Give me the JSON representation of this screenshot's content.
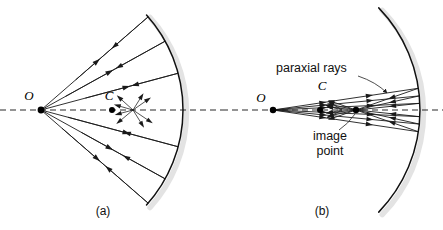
{
  "figure": {
    "background_color": "#ffffff",
    "ink_color": "#1a1a1a",
    "halo_color": "#e3e3e3"
  },
  "panels": [
    {
      "id": "a",
      "caption": "(a)",
      "caption_x": 103,
      "caption_y": 215,
      "description": "Wide-angle rays from a point source O reflect off a concave mirror and do not converge to a single point (spherical aberration).",
      "source_label": "O",
      "source_label_x": 29,
      "source_label_y": 100,
      "source_point": {
        "x": 41,
        "y": 110,
        "r": 3.4
      },
      "center_label": "C",
      "center_label_x": 109,
      "center_label_y": 100,
      "center_point": {
        "x": 112,
        "y": 110,
        "r": 3.0
      },
      "axis": {
        "x1": 0,
        "y1": 110,
        "x2": 222,
        "y2": 110
      },
      "mirror": {
        "center_x": 41,
        "center_y": 110,
        "radius": 142,
        "start_angle_deg": -42,
        "end_angle_deg": 42,
        "vertex_x": 183
      },
      "incident_rays": [
        {
          "angle_deg": -41,
          "arrow_t": 0.52
        },
        {
          "angle_deg": -29,
          "arrow_t": 0.55
        },
        {
          "angle_deg": -15,
          "arrow_t": 0.62
        },
        {
          "angle_deg": 15,
          "arrow_t": 0.62
        },
        {
          "angle_deg": 29,
          "arrow_t": 0.55
        },
        {
          "angle_deg": 41,
          "arrow_t": 0.52
        }
      ],
      "caustic_center": {
        "x": 133,
        "y": 110
      },
      "short_arrows": [
        {
          "angle_deg": 140,
          "len": 18
        },
        {
          "angle_deg": 165,
          "len": 15
        },
        {
          "angle_deg": 196,
          "len": 16
        },
        {
          "angle_deg": 222,
          "len": 18
        },
        {
          "angle_deg": 58,
          "len": 17
        },
        {
          "angle_deg": 34,
          "len": 20
        },
        {
          "angle_deg": 325,
          "len": 18
        },
        {
          "angle_deg": 302,
          "len": 16
        }
      ]
    },
    {
      "id": "b",
      "caption": "(b)",
      "caption_x": 322,
      "caption_y": 215,
      "description": "Paraxial rays making small angles with the axis converge to a sharp image point.",
      "source_label": "O",
      "source_label_x": 261,
      "source_label_y": 102,
      "source_point": {
        "x": 273,
        "y": 110,
        "r": 3.2
      },
      "center_label": "C",
      "center_label_x": 322,
      "center_label_y": 90,
      "center_point": {
        "x": 320,
        "y": 110,
        "r": 3.0
      },
      "image_point": {
        "x": 356,
        "y": 110,
        "r": 3.2
      },
      "axis": {
        "x1": 222,
        "y1": 110,
        "x2": 443,
        "y2": 110
      },
      "mirror": {
        "center_x": 273,
        "center_y": 110,
        "radius": 147,
        "start_angle_deg": -44,
        "end_angle_deg": 44,
        "vertex_x": 420
      },
      "paraxial_rays": [
        {
          "angle_deg": -8.5
        },
        {
          "angle_deg": -5.5
        },
        {
          "angle_deg": -2.6
        },
        {
          "angle_deg": 2.6
        },
        {
          "angle_deg": 5.5
        },
        {
          "angle_deg": 8.5
        }
      ],
      "annotations": [
        {
          "name": "paraxial-rays-label",
          "text": "paraxial rays",
          "x": 276,
          "y": 72,
          "anchor": "start",
          "leader": {
            "x1": 358,
            "y1": 76,
            "cx": 376,
            "cy": 82,
            "x2": 387,
            "y2": 93
          }
        },
        {
          "name": "image-point-label",
          "text_line_1": "image",
          "text_line_2": "point",
          "x": 330,
          "y": 140,
          "anchor": "middle",
          "leader": {
            "x1": 339,
            "y1": 130,
            "cx": 348,
            "cy": 124,
            "x2": 355,
            "y2": 114
          }
        }
      ],
      "stray_arrows": [
        {
          "angle_deg": 152,
          "len": 14
        },
        {
          "angle_deg": 168,
          "len": 13
        },
        {
          "angle_deg": 196,
          "len": 14
        },
        {
          "angle_deg": 212,
          "len": 13
        }
      ]
    }
  ]
}
